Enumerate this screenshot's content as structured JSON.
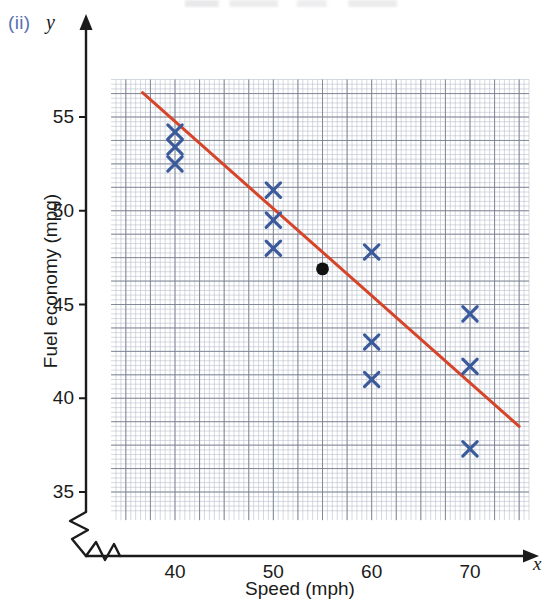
{
  "figure": {
    "label": "(ii)",
    "y_symbol": "y",
    "x_symbol": "x"
  },
  "chart_data": {
    "type": "scatter",
    "title": "",
    "xlabel": "Speed (mph)",
    "ylabel": "Fuel economy (mpg)",
    "xlim": [
      33.5,
      76.0
    ],
    "ylim": [
      33.5,
      57.0
    ],
    "xticks": [
      40,
      50,
      60,
      70
    ],
    "xtick_labels": [
      "40",
      "50",
      "60",
      "70"
    ],
    "yticks": [
      35,
      40,
      45,
      50,
      55
    ],
    "ytick_labels": [
      "35",
      "40",
      "45",
      "50",
      "55"
    ],
    "grid": true,
    "grid_minor_step_x": 0.5,
    "grid_minor_step_y": 0.25,
    "grid_major_step_x": 2.5,
    "grid_major_step_y": 1.25,
    "legend": null,
    "axis_break_x": true,
    "axis_break_y": true,
    "marker_style": "x-cross",
    "marker_color": "#3a5a9b",
    "series": [
      {
        "name": "Observations",
        "marker": "x",
        "color": "#3a5a9b",
        "points": [
          {
            "x": 40,
            "y": 54.2
          },
          {
            "x": 40,
            "y": 53.4
          },
          {
            "x": 40,
            "y": 52.5
          },
          {
            "x": 50,
            "y": 51.1
          },
          {
            "x": 50,
            "y": 49.5
          },
          {
            "x": 50,
            "y": 48.0
          },
          {
            "x": 60,
            "y": 47.8
          },
          {
            "x": 60,
            "y": 43.0
          },
          {
            "x": 60,
            "y": 41.0
          },
          {
            "x": 70,
            "y": 44.5
          },
          {
            "x": 70,
            "y": 41.7
          },
          {
            "x": 70,
            "y": 37.3
          }
        ]
      },
      {
        "name": "Mean point",
        "marker": "filled-circle",
        "color": "#111111",
        "points": [
          {
            "x": 55,
            "y": 46.9
          }
        ]
      }
    ],
    "line_of_best_fit": {
      "name": "Line of best fit",
      "color": "#d6442a",
      "x_start": 36.7,
      "y_start": 56.3,
      "x_end": 75.0,
      "y_end": 38.5
    }
  }
}
